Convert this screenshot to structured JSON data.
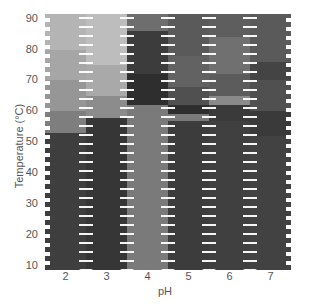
{
  "chart_data": {
    "type": "heatmap",
    "title": "",
    "xlabel": "pH",
    "ylabel": "Temperature (°C)",
    "x_ticks": [
      "2",
      "3",
      "4",
      "5",
      "6",
      "7"
    ],
    "y_ticks": [
      "90",
      "80",
      "70",
      "60",
      "50",
      "40",
      "30",
      "20",
      "10"
    ],
    "ylim": [
      10,
      90
    ],
    "colormap": "grayscale (light = high value, dark = low value)",
    "columns": [
      {
        "ph": 2,
        "bands": [
          {
            "from": 90,
            "to": 80,
            "color": "#b4b4b4"
          },
          {
            "from": 80,
            "to": 70,
            "color": "#a6a6a6"
          },
          {
            "from": 70,
            "to": 60,
            "color": "#969696"
          },
          {
            "from": 60,
            "to": 53,
            "color": "#7e7e7e"
          },
          {
            "from": 53,
            "to": 10,
            "color": "#3e3e3e"
          }
        ]
      },
      {
        "ph": 3,
        "bands": [
          {
            "from": 90,
            "to": 75,
            "color": "#bdbdbd"
          },
          {
            "from": 75,
            "to": 65,
            "color": "#a9a9a9"
          },
          {
            "from": 65,
            "to": 58,
            "color": "#8c8c8c"
          },
          {
            "from": 58,
            "to": 10,
            "color": "#363636"
          }
        ]
      },
      {
        "ph": 4,
        "bands": [
          {
            "from": 90,
            "to": 86,
            "color": "#6e6e6e"
          },
          {
            "from": 86,
            "to": 72,
            "color": "#3c3c3c"
          },
          {
            "from": 72,
            "to": 62,
            "color": "#2e2e2e"
          },
          {
            "from": 62,
            "to": 10,
            "color": "#7a7a7a"
          }
        ]
      },
      {
        "ph": 5,
        "bands": [
          {
            "from": 90,
            "to": 78,
            "color": "#5a5a5a"
          },
          {
            "from": 78,
            "to": 68,
            "color": "#626262"
          },
          {
            "from": 68,
            "to": 62,
            "color": "#505050"
          },
          {
            "from": 62,
            "to": 59,
            "color": "#2e2e2e"
          },
          {
            "from": 59,
            "to": 57,
            "color": "#7a7a7a"
          },
          {
            "from": 57,
            "to": 10,
            "color": "#3c3c3c"
          }
        ]
      },
      {
        "ph": 6,
        "bands": [
          {
            "from": 90,
            "to": 84,
            "color": "#5e5e5e"
          },
          {
            "from": 84,
            "to": 72,
            "color": "#707070"
          },
          {
            "from": 72,
            "to": 65,
            "color": "#5c5c5c"
          },
          {
            "from": 65,
            "to": 62,
            "color": "#8a8a8a"
          },
          {
            "from": 62,
            "to": 57,
            "color": "#3a3a3a"
          },
          {
            "from": 57,
            "to": 10,
            "color": "#404040"
          }
        ]
      },
      {
        "ph": 7,
        "bands": [
          {
            "from": 90,
            "to": 76,
            "color": "#5a5a5a"
          },
          {
            "from": 76,
            "to": 70,
            "color": "#444444"
          },
          {
            "from": 70,
            "to": 60,
            "color": "#505050"
          },
          {
            "from": 60,
            "to": 52,
            "color": "#3a3a3a"
          },
          {
            "from": 52,
            "to": 10,
            "color": "#424242"
          }
        ]
      }
    ],
    "grid": false,
    "legend": "none"
  }
}
